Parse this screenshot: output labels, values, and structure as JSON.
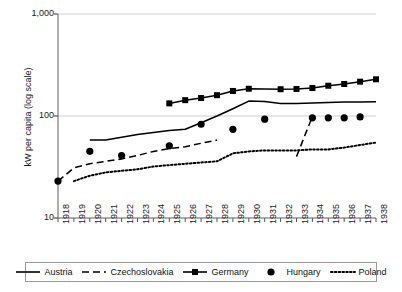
{
  "chart_data": {
    "type": "line",
    "title": "",
    "xlabel": "",
    "ylabel": "kW per capita (log scale)",
    "yscale": "log",
    "ylim": [
      10,
      1000
    ],
    "ytick_labels": [
      "1,000",
      "100",
      "10"
    ],
    "ytick_values": [
      1000,
      100,
      10
    ],
    "grid": "horizontal",
    "legend_position": "bottom",
    "x": [
      1918,
      1919,
      1920,
      1921,
      1922,
      1923,
      1924,
      1925,
      1926,
      1927,
      1928,
      1929,
      1930,
      1931,
      1932,
      1933,
      1934,
      1935,
      1936,
      1937,
      1938
    ],
    "xtick_labels": [
      "1918",
      "1919",
      "1920",
      "1921",
      "1922",
      "1923",
      "1924",
      "1925",
      "1926",
      "1927",
      "1928",
      "1929",
      "1930",
      "1931",
      "1932",
      "1933",
      "1934",
      "1935",
      "1936",
      "1937",
      "1938"
    ],
    "series": [
      {
        "name": "Austria",
        "style": "solid-line",
        "marker": "none",
        "color": "#000000",
        "points": [
          {
            "x": 1920,
            "y": 58
          },
          {
            "x": 1921,
            "y": 58
          },
          {
            "x": 1922,
            "y": 62
          },
          {
            "x": 1923,
            "y": 66
          },
          {
            "x": 1924,
            "y": 69
          },
          {
            "x": 1925,
            "y": 72
          },
          {
            "x": 1926,
            "y": 74
          },
          {
            "x": 1927,
            "y": 86
          },
          {
            "x": 1928,
            "y": 100
          },
          {
            "x": 1929,
            "y": 118
          },
          {
            "x": 1930,
            "y": 140
          },
          {
            "x": 1931,
            "y": 139
          },
          {
            "x": 1932,
            "y": 133
          },
          {
            "x": 1933,
            "y": 133
          },
          {
            "x": 1934,
            "y": 134
          },
          {
            "x": 1935,
            "y": 136
          },
          {
            "x": 1936,
            "y": 137
          },
          {
            "x": 1937,
            "y": 137
          },
          {
            "x": 1938,
            "y": 138
          }
        ]
      },
      {
        "name": "Czechoslovakia",
        "style": "dashed-line",
        "marker": "none",
        "color": "#000000",
        "points": [
          {
            "x": 1918,
            "y": 23
          },
          {
            "x": 1919,
            "y": 31
          },
          {
            "x": 1920,
            "y": 34
          },
          {
            "x": 1921,
            "y": 36
          },
          {
            "x": 1922,
            "y": 38
          },
          {
            "x": 1923,
            "y": 41
          },
          {
            "x": 1924,
            "y": 45
          },
          {
            "x": 1925,
            "y": 48
          },
          {
            "x": 1926,
            "y": 50
          },
          {
            "x": 1927,
            "y": 54
          },
          {
            "x": 1928,
            "y": 58
          },
          {
            "x": 1933,
            "y": 40
          },
          {
            "x": 1934,
            "y": 99
          }
        ]
      },
      {
        "name": "Germany",
        "style": "solid-line",
        "marker": "square",
        "color": "#000000",
        "points": [
          {
            "x": 1925,
            "y": 133
          },
          {
            "x": 1926,
            "y": 143
          },
          {
            "x": 1927,
            "y": 150
          },
          {
            "x": 1928,
            "y": 160
          },
          {
            "x": 1929,
            "y": 176
          },
          {
            "x": 1930,
            "y": 185
          },
          {
            "x": 1932,
            "y": 183
          },
          {
            "x": 1933,
            "y": 184
          },
          {
            "x": 1934,
            "y": 188
          },
          {
            "x": 1935,
            "y": 198
          },
          {
            "x": 1936,
            "y": 206
          },
          {
            "x": 1937,
            "y": 217
          },
          {
            "x": 1938,
            "y": 229
          }
        ]
      },
      {
        "name": "Hungary",
        "style": "markers-only",
        "marker": "circle",
        "color": "#000000",
        "points": [
          {
            "x": 1918,
            "y": 23
          },
          {
            "x": 1920,
            "y": 45
          },
          {
            "x": 1922,
            "y": 41
          },
          {
            "x": 1925,
            "y": 51
          },
          {
            "x": 1927,
            "y": 83
          },
          {
            "x": 1929,
            "y": 74
          },
          {
            "x": 1931,
            "y": 93
          },
          {
            "x": 1934,
            "y": 96
          },
          {
            "x": 1935,
            "y": 96
          },
          {
            "x": 1936,
            "y": 96
          },
          {
            "x": 1937,
            "y": 98
          }
        ]
      },
      {
        "name": "Poland",
        "style": "dotted-line",
        "marker": "none",
        "color": "#000000",
        "points": [
          {
            "x": 1919,
            "y": 23
          },
          {
            "x": 1920,
            "y": 26
          },
          {
            "x": 1921,
            "y": 28
          },
          {
            "x": 1922,
            "y": 29
          },
          {
            "x": 1923,
            "y": 30
          },
          {
            "x": 1924,
            "y": 32
          },
          {
            "x": 1925,
            "y": 33
          },
          {
            "x": 1926,
            "y": 34
          },
          {
            "x": 1927,
            "y": 35
          },
          {
            "x": 1928,
            "y": 36
          },
          {
            "x": 1929,
            "y": 43
          },
          {
            "x": 1930,
            "y": 45
          },
          {
            "x": 1931,
            "y": 46
          },
          {
            "x": 1932,
            "y": 46
          },
          {
            "x": 1933,
            "y": 46
          },
          {
            "x": 1934,
            "y": 47
          },
          {
            "x": 1935,
            "y": 47
          },
          {
            "x": 1936,
            "y": 49
          },
          {
            "x": 1937,
            "y": 52
          },
          {
            "x": 1938,
            "y": 55
          }
        ]
      }
    ],
    "legend": [
      {
        "label": "Austria",
        "style": "solid-line",
        "marker": "none"
      },
      {
        "label": "Czechoslovakia",
        "style": "dashed-line",
        "marker": "none"
      },
      {
        "label": "Germany",
        "style": "solid-line",
        "marker": "square"
      },
      {
        "label": "Hungary",
        "style": "markers-only",
        "marker": "circle"
      },
      {
        "label": "Poland",
        "style": "dotted-line",
        "marker": "none"
      }
    ]
  },
  "plot_geometry": {
    "left": 58,
    "right": 376,
    "top": 14,
    "bottom": 218
  }
}
